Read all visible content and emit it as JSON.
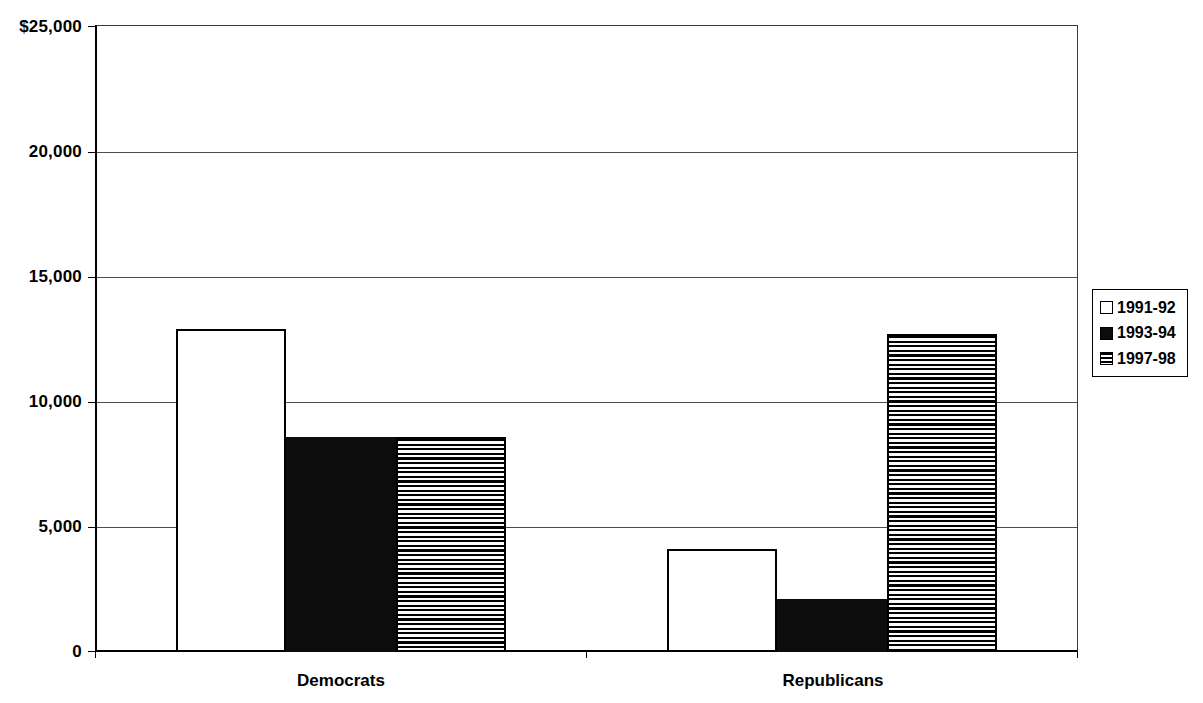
{
  "chart_data": {
    "type": "bar",
    "categories": [
      "Democrats",
      "Republicans"
    ],
    "series": [
      {
        "name": "1991-92",
        "pattern": "solid-white",
        "values": [
          12900,
          4100
        ]
      },
      {
        "name": "1993-94",
        "pattern": "solid-black",
        "values": [
          8600,
          2100
        ]
      },
      {
        "name": "1997-98",
        "pattern": "horizontal-stripes",
        "values": [
          8600,
          12700
        ]
      }
    ],
    "title": "",
    "xlabel": "",
    "ylabel": "",
    "ylim": [
      0,
      25000
    ],
    "y_tick_interval": 5000,
    "y_tick_labels": [
      "$25,000",
      "20,000",
      "15,000",
      "10,000",
      "5,000",
      "0"
    ],
    "grid": true,
    "legend_position": "right"
  },
  "colors": {
    "ink": "#000000",
    "grid_line": "#4d4d4d",
    "background": "#ffffff"
  }
}
